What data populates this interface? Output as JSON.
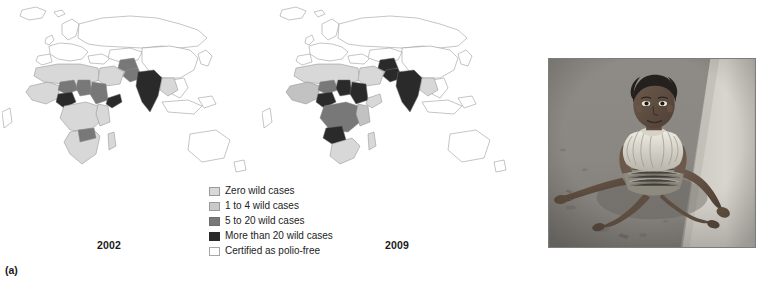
{
  "figure": {
    "panels": [
      {
        "tag": "(a)",
        "kind": "maps"
      },
      {
        "tag": "(b)",
        "kind": "photograph"
      }
    ]
  },
  "panel_a": {
    "tag": "(a)",
    "maps": [
      {
        "year_label": "2002",
        "name": "world-map-2002"
      },
      {
        "year_label": "2009",
        "name": "world-map-2009"
      }
    ],
    "legend": {
      "items": [
        {
          "label": "Zero wild cases",
          "color": "#d8d8d8"
        },
        {
          "label": "1 to 4 wild cases",
          "color": "#c2c2c2"
        },
        {
          "label": "5 to 20 wild cases",
          "color": "#787878"
        },
        {
          "label": "More than 20 wild cases",
          "color": "#2a2a2a"
        },
        {
          "label": "Certified as polio-free",
          "color": "#ffffff"
        }
      ]
    }
  },
  "panel_b": {
    "tag": "(b)",
    "photo_alt": "Black and white photograph of a young girl with polio-affected legs sitting on the ground, leaning forward on her hands"
  },
  "map_data": {
    "type": "choropleth",
    "projection": "world-eastern-hemisphere",
    "categories": [
      "Zero wild cases",
      "1 to 4 wild cases",
      "5 to 20 wild cases",
      "More than 20 wild cases",
      "Certified as polio-free"
    ],
    "category_colors": [
      "#d8d8d8",
      "#c2c2c2",
      "#787878",
      "#2a2a2a",
      "#ffffff"
    ],
    "maps": [
      {
        "year": "2002",
        "regions": [
          {
            "name": "Europe",
            "category": "Certified as polio-free"
          },
          {
            "name": "Russia",
            "category": "Certified as polio-free"
          },
          {
            "name": "China",
            "category": "Certified as polio-free"
          },
          {
            "name": "Southeast Asia",
            "category": "Certified as polio-free"
          },
          {
            "name": "Australia",
            "category": "Certified as polio-free"
          },
          {
            "name": "North Africa",
            "category": "Zero wild cases"
          },
          {
            "name": "West Africa",
            "category": "Zero wild cases"
          },
          {
            "name": "Nigeria",
            "category": "More than 20 wild cases"
          },
          {
            "name": "Niger",
            "category": "5 to 20 wild cases"
          },
          {
            "name": "Chad",
            "category": "5 to 20 wild cases"
          },
          {
            "name": "Sudan",
            "category": "5 to 20 wild cases"
          },
          {
            "name": "Somalia",
            "category": "More than 20 wild cases"
          },
          {
            "name": "Zambia",
            "category": "5 to 20 wild cases"
          },
          {
            "name": "Central Africa",
            "category": "Zero wild cases"
          },
          {
            "name": "Afghanistan",
            "category": "5 to 20 wild cases"
          },
          {
            "name": "Pakistan",
            "category": "5 to 20 wild cases"
          },
          {
            "name": "India",
            "category": "More than 20 wild cases"
          },
          {
            "name": "Middle East",
            "category": "Zero wild cases"
          }
        ]
      },
      {
        "year": "2009",
        "regions": [
          {
            "name": "Europe",
            "category": "Certified as polio-free"
          },
          {
            "name": "Russia",
            "category": "Certified as polio-free"
          },
          {
            "name": "China",
            "category": "Certified as polio-free"
          },
          {
            "name": "Southeast Asia",
            "category": "Certified as polio-free"
          },
          {
            "name": "Australia",
            "category": "Certified as polio-free"
          },
          {
            "name": "North Africa",
            "category": "Zero wild cases"
          },
          {
            "name": "West Africa",
            "category": "1 to 4 wild cases"
          },
          {
            "name": "Nigeria",
            "category": "More than 20 wild cases"
          },
          {
            "name": "Niger",
            "category": "5 to 20 wild cases"
          },
          {
            "name": "Chad",
            "category": "More than 20 wild cases"
          },
          {
            "name": "Sudan",
            "category": "More than 20 wild cases"
          },
          {
            "name": "Angola",
            "category": "More than 20 wild cases"
          },
          {
            "name": "DR Congo",
            "category": "5 to 20 wild cases"
          },
          {
            "name": "Kenya",
            "category": "1 to 4 wild cases"
          },
          {
            "name": "Afghanistan",
            "category": "More than 20 wild cases"
          },
          {
            "name": "Pakistan",
            "category": "More than 20 wild cases"
          },
          {
            "name": "India",
            "category": "More than 20 wild cases"
          },
          {
            "name": "Middle East",
            "category": "Zero wild cases"
          }
        ]
      }
    ]
  }
}
